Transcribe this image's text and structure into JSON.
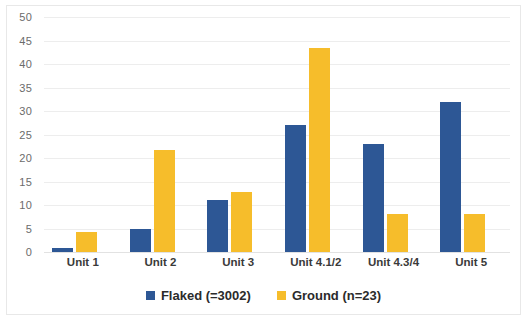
{
  "chart_data": {
    "type": "bar",
    "title": "",
    "xlabel": "",
    "ylabel": "",
    "ylim": [
      0,
      50
    ],
    "ytick_step": 5,
    "yticks": [
      "50",
      "45",
      "40",
      "35",
      "30",
      "25",
      "20",
      "15",
      "10",
      "5",
      "0"
    ],
    "grid": true,
    "legend_position": "bottom-center",
    "categories": [
      "Unit 1",
      "Unit 2",
      "Unit 3",
      "Unit 4.1/2",
      "Unit 4.3/4",
      "Unit 5"
    ],
    "series": [
      {
        "name": "Flaked (=3002)",
        "color": "#2d5795",
        "values": [
          0.8,
          5,
          11,
          27,
          23,
          32
        ]
      },
      {
        "name": "Ground (n=23)",
        "color": "#f6bd2b",
        "values": [
          4.3,
          21.7,
          12.8,
          43.5,
          8,
          8
        ]
      }
    ]
  },
  "legend": {
    "items": [
      {
        "label": "Flaked (=3002)",
        "color": "#2d5795"
      },
      {
        "label": "Ground (n=23)",
        "color": "#f6bd2b"
      }
    ]
  }
}
